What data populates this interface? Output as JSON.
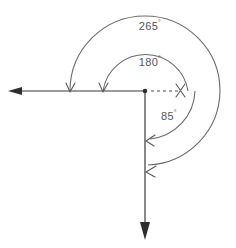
{
  "diagram": {
    "background_color": "#ffffff",
    "line_color": "#3a3a3a",
    "arc_color": "#6b6b6b",
    "label_color": "#555555",
    "vertex": {
      "x": 145,
      "y": 91,
      "label": "vertex-point"
    },
    "rays": [
      {
        "name": "horizontal-left-ray",
        "from_x": 145,
        "from_y": 91,
        "to_x": 10,
        "to_y": 91,
        "arrowhead": "solid",
        "style": "solid"
      },
      {
        "name": "vertical-down-ray",
        "from_x": 145,
        "from_y": 91,
        "to_x": 145,
        "to_y": 238,
        "arrowhead": "solid",
        "style": "solid"
      },
      {
        "name": "dashed-reference-ray",
        "from_x": 150,
        "from_y": 91,
        "to_x": 181,
        "to_y": 91,
        "arrowhead": "none",
        "style": "dashed"
      }
    ],
    "arcs": [
      {
        "name": "arc-180",
        "label": "180",
        "degree_symbol": "°",
        "value": 180,
        "radius": 43,
        "start_angle_deg": 0,
        "end_angle_deg": 180,
        "sweep": "counterclockwise-over-top",
        "start_x": 188,
        "start_y": 91,
        "end_x": 103,
        "end_y": 91,
        "arrow_at": "end-on-horizontal-ray",
        "label_x": 150,
        "label_y": 63
      },
      {
        "name": "arc-265",
        "label": "265",
        "degree_symbol": "°",
        "value": 265,
        "radius": 75,
        "start_angle_deg": 0,
        "end_angle_deg": 265,
        "sweep": "counterclockwise-over-top",
        "start_x": 220,
        "start_y": 91,
        "end_x": 70,
        "end_y": 91,
        "arrow_at": "end-on-horizontal-ray",
        "label_x": 150,
        "label_y": 27
      },
      {
        "name": "arc-85",
        "label": "85",
        "degree_symbol": "°",
        "value": 85,
        "radius": 50,
        "start_angle_deg": 0,
        "end_angle_deg": -85,
        "sweep": "clockwise-downward",
        "start_x": 195,
        "start_y": 91,
        "end_x": 149,
        "end_y": 141,
        "arrow_at": "end-on-vertical-ray",
        "label_x": 169,
        "label_y": 117
      }
    ],
    "arc_arrowheads": [
      {
        "name": "arrowhead-265-on-horizontal",
        "x": 70,
        "y": 91,
        "direction": "down"
      },
      {
        "name": "arrowhead-180-on-horizontal",
        "x": 103,
        "y": 91,
        "direction": "down"
      },
      {
        "name": "arrowhead-85-on-vertical",
        "x": 147,
        "y": 141,
        "direction": "down-left"
      },
      {
        "name": "arrowhead-265-on-vertical",
        "x": 147,
        "y": 172,
        "direction": "down-left"
      },
      {
        "name": "arrowhead-start-marker-right",
        "x": 181,
        "y": 91,
        "direction": "cross"
      }
    ],
    "labels": [
      {
        "name": "label-265",
        "text": "265",
        "symbol": "°"
      },
      {
        "name": "label-180",
        "text": "180",
        "symbol": "°"
      },
      {
        "name": "label-85",
        "text": "85",
        "symbol": "°"
      }
    ]
  }
}
